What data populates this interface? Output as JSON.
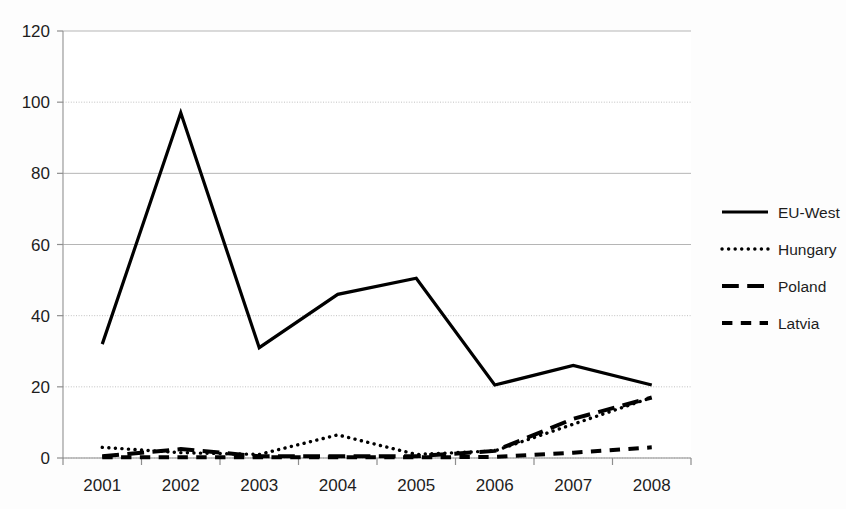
{
  "chart_data": {
    "type": "line",
    "title": "",
    "xlabel": "",
    "ylabel": "",
    "x": [
      "2001",
      "2002",
      "2003",
      "2004",
      "2005",
      "2006",
      "2007",
      "2008"
    ],
    "categories": [
      "2001",
      "2002",
      "2003",
      "2004",
      "2005",
      "2006",
      "2007",
      "2008"
    ],
    "ylim": [
      0,
      120
    ],
    "yticks": [
      0,
      20,
      40,
      60,
      80,
      100,
      120
    ],
    "ytick_labels": [
      "0",
      "20",
      "40",
      "60",
      "80",
      "100",
      "120"
    ],
    "grid": true,
    "grid_axis": "y",
    "legend_position": "right",
    "series": [
      {
        "name": "EU-West",
        "style": "solid",
        "color": "#000000",
        "values": [
          32,
          97,
          31,
          46,
          50.5,
          20.5,
          26,
          20.5
        ]
      },
      {
        "name": "Hungary",
        "style": "dotted",
        "color": "#000000",
        "values": [
          3,
          1.5,
          1,
          6.5,
          1,
          2,
          9.5,
          17
        ]
      },
      {
        "name": "Poland",
        "style": "long-dash",
        "color": "#000000",
        "values": [
          0.5,
          2.5,
          0.5,
          0.5,
          0.5,
          2,
          11,
          17
        ]
      },
      {
        "name": "Latvia",
        "style": "dash",
        "color": "#000000",
        "values": [
          0.2,
          0.2,
          0.2,
          0.2,
          0.2,
          0.3,
          1.5,
          3
        ]
      }
    ]
  },
  "legend": {
    "items": [
      {
        "label": "EU-West",
        "style": "solid"
      },
      {
        "label": "Hungary",
        "style": "dotted"
      },
      {
        "label": "Poland",
        "style": "long-dash"
      },
      {
        "label": "Latvia",
        "style": "dash"
      }
    ]
  },
  "axes": {
    "y_tick_labels": [
      "120",
      "100",
      "80",
      "60",
      "40",
      "20",
      "0"
    ],
    "x_tick_labels": [
      "2001",
      "2002",
      "2003",
      "2004",
      "2005",
      "2006",
      "2007",
      "2008"
    ]
  }
}
